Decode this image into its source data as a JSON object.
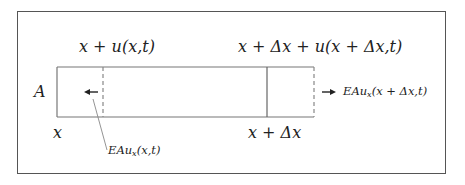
{
  "diagram": {
    "labels": {
      "area": "A",
      "left_position": "x",
      "right_position": "x + Δx",
      "left_displaced": "x + u(x,t)",
      "right_displaced": "x + Δx + u(x + Δx,t)",
      "left_force_prefix": "EAu",
      "left_force_sub": "x",
      "left_force_args": "(x,t)",
      "right_force_prefix": "EAu",
      "right_force_sub": "x",
      "right_force_args": "(x + Δx,t)"
    },
    "colors": {
      "frame": "#555555",
      "bar": "#777777",
      "dashed": "#888888",
      "text": "#222222"
    }
  }
}
